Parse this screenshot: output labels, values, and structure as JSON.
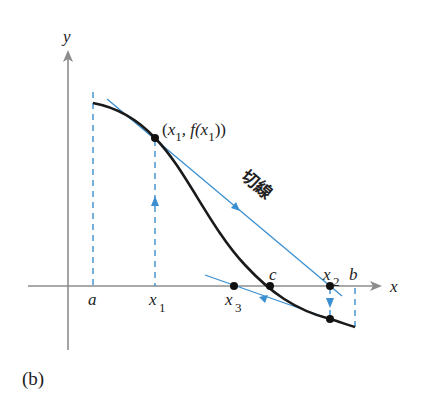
{
  "figure": {
    "caption": "(b)",
    "axes": {
      "x_label": "x",
      "y_label": "y"
    },
    "colors": {
      "axis": "#8c8c8c",
      "curve": "#1a1a1a",
      "tangent": "#3a8fd0",
      "guide": "#3a8fd0",
      "point": "#111111"
    },
    "labels": {
      "a": "a",
      "x1_main": "x",
      "x1_sub": "1",
      "x3_main": "x",
      "x3_sub": "3",
      "c": "c",
      "x2_main": "x",
      "x2_sub": "2",
      "b": "b",
      "point_label_open": "(",
      "point_label_x": "x",
      "point_label_sub1": "1",
      "point_label_mid": ", f(",
      "point_label_x2": "x",
      "point_label_sub2": "1",
      "point_label_close": "))",
      "tangent_label": "切線"
    }
  }
}
